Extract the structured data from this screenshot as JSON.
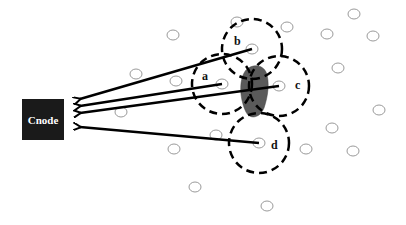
{
  "diagram": {
    "sink": {
      "label": "Cnode",
      "color": "#1a1a1a"
    },
    "cluster_heads": [
      {
        "id": "a",
        "label": "a",
        "x": 222,
        "y": 84,
        "range_r": 30
      },
      {
        "id": "b",
        "label": "b",
        "x": 252,
        "y": 49,
        "range_r": 30
      },
      {
        "id": "c",
        "label": "c",
        "x": 279,
        "y": 86,
        "range_r": 30
      },
      {
        "id": "d",
        "label": "d",
        "x": 259,
        "y": 143,
        "range_r": 30
      }
    ],
    "sensor_nodes": [
      {
        "x": 237,
        "y": 22
      },
      {
        "x": 354,
        "y": 14
      },
      {
        "x": 287,
        "y": 27
      },
      {
        "x": 327,
        "y": 34
      },
      {
        "x": 373,
        "y": 36
      },
      {
        "x": 173,
        "y": 35
      },
      {
        "x": 136,
        "y": 74
      },
      {
        "x": 176,
        "y": 81
      },
      {
        "x": 338,
        "y": 68
      },
      {
        "x": 379,
        "y": 110
      },
      {
        "x": 121,
        "y": 112
      },
      {
        "x": 216,
        "y": 135
      },
      {
        "x": 332,
        "y": 128
      },
      {
        "x": 306,
        "y": 149
      },
      {
        "x": 353,
        "y": 151
      },
      {
        "x": 174,
        "y": 149
      },
      {
        "x": 195,
        "y": 187
      },
      {
        "x": 267,
        "y": 206
      }
    ],
    "obstacle": {
      "color": "#555555"
    },
    "arrows": [
      {
        "from": "b",
        "to": "sink"
      },
      {
        "from": "a",
        "to": "sink"
      },
      {
        "from": "c",
        "to": "sink"
      },
      {
        "from": "d",
        "to": "sink"
      }
    ]
  }
}
